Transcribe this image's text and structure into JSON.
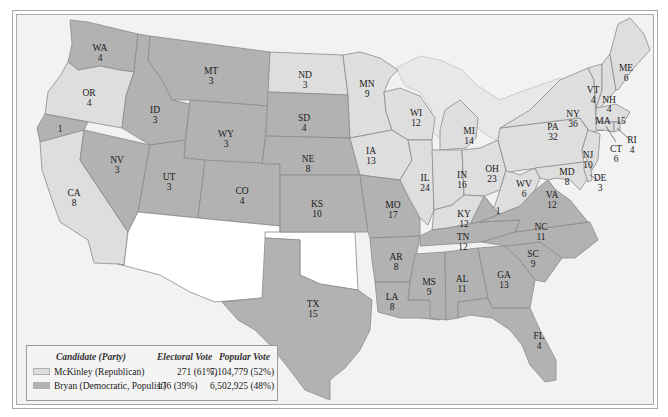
{
  "colors": {
    "republican": "#dedede",
    "democratic": "#b2b2b2",
    "territory": "#ffffff",
    "water": "#f2f2f2",
    "lakes": "#e8e8e8",
    "border": "#8a8a8a"
  },
  "states": [
    {
      "abbr": "WA",
      "ev": "4",
      "party": "democratic"
    },
    {
      "abbr": "OR",
      "ev": "4",
      "party": "republican"
    },
    {
      "abbr": "CA",
      "ev": "8",
      "party": "republican",
      "split": "1"
    },
    {
      "abbr": "NV",
      "ev": "3",
      "party": "democratic"
    },
    {
      "abbr": "ID",
      "ev": "3",
      "party": "democratic"
    },
    {
      "abbr": "MT",
      "ev": "3",
      "party": "democratic"
    },
    {
      "abbr": "WY",
      "ev": "3",
      "party": "democratic"
    },
    {
      "abbr": "UT",
      "ev": "3",
      "party": "democratic"
    },
    {
      "abbr": "CO",
      "ev": "4",
      "party": "democratic"
    },
    {
      "abbr": "ND",
      "ev": "3",
      "party": "republican"
    },
    {
      "abbr": "SD",
      "ev": "4",
      "party": "democratic"
    },
    {
      "abbr": "NE",
      "ev": "8",
      "party": "democratic"
    },
    {
      "abbr": "KS",
      "ev": "10",
      "party": "democratic"
    },
    {
      "abbr": "TX",
      "ev": "15",
      "party": "democratic"
    },
    {
      "abbr": "MN",
      "ev": "9",
      "party": "republican"
    },
    {
      "abbr": "IA",
      "ev": "13",
      "party": "republican"
    },
    {
      "abbr": "MO",
      "ev": "17",
      "party": "democratic"
    },
    {
      "abbr": "AR",
      "ev": "8",
      "party": "democratic"
    },
    {
      "abbr": "LA",
      "ev": "8",
      "party": "democratic"
    },
    {
      "abbr": "WI",
      "ev": "12",
      "party": "republican"
    },
    {
      "abbr": "IL",
      "ev": "24",
      "party": "republican"
    },
    {
      "abbr": "MI",
      "ev": "14",
      "party": "republican"
    },
    {
      "abbr": "IN",
      "ev": "16",
      "party": "republican"
    },
    {
      "abbr": "OH",
      "ev": "23",
      "party": "republican"
    },
    {
      "abbr": "KY",
      "ev": "12",
      "party": "republican",
      "split": "1"
    },
    {
      "abbr": "TN",
      "ev": "12",
      "party": "democratic"
    },
    {
      "abbr": "MS",
      "ev": "9",
      "party": "democratic"
    },
    {
      "abbr": "AL",
      "ev": "11",
      "party": "democratic"
    },
    {
      "abbr": "GA",
      "ev": "13",
      "party": "democratic"
    },
    {
      "abbr": "FL",
      "ev": "4",
      "party": "democratic"
    },
    {
      "abbr": "SC",
      "ev": "9",
      "party": "democratic"
    },
    {
      "abbr": "NC",
      "ev": "11",
      "party": "democratic"
    },
    {
      "abbr": "VA",
      "ev": "12",
      "party": "democratic"
    },
    {
      "abbr": "WV",
      "ev": "6",
      "party": "republican"
    },
    {
      "abbr": "PA",
      "ev": "32",
      "party": "republican"
    },
    {
      "abbr": "NY",
      "ev": "36",
      "party": "republican"
    },
    {
      "abbr": "MD",
      "ev": "8",
      "party": "republican"
    },
    {
      "abbr": "DE",
      "ev": "3",
      "party": "republican"
    },
    {
      "abbr": "NJ",
      "ev": "10",
      "party": "republican"
    },
    {
      "abbr": "CT",
      "ev": "6",
      "party": "republican"
    },
    {
      "abbr": "RI",
      "ev": "4",
      "party": "republican"
    },
    {
      "abbr": "MA",
      "ev": "15",
      "party": "republican"
    },
    {
      "abbr": "VT",
      "ev": "4",
      "party": "republican"
    },
    {
      "abbr": "NH",
      "ev": "4",
      "party": "republican"
    },
    {
      "abbr": "ME",
      "ev": "6",
      "party": "republican"
    }
  ],
  "legend": {
    "headers": {
      "candidate": "Candidate (Party)",
      "electoral": "Electoral Vote",
      "popular": "Popular Vote"
    },
    "rows": [
      {
        "candidate": "McKinley (Republican)",
        "electoral": "271 (61%)",
        "popular": "7,104,779 (52%)",
        "swatch": "#dedede"
      },
      {
        "candidate": "Bryan (Democratic, Populist)",
        "electoral": "176 (39%)",
        "popular": "6,502,925 (48%)",
        "swatch": "#b2b2b2"
      }
    ]
  }
}
